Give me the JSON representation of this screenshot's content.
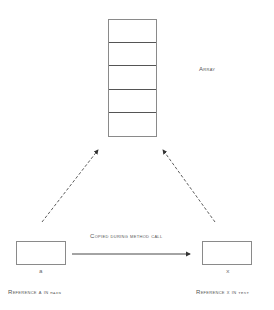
{
  "diagram": {
    "array": {
      "label": "Array",
      "cells": 5
    },
    "left_box": {
      "var": "a",
      "caption_prefix": "Reference a in ",
      "caption_code": "main"
    },
    "right_box": {
      "var": "x",
      "caption_prefix": "Reference x in ",
      "caption_code": "test"
    },
    "arrow_label": "Copied during method call",
    "colors": {
      "stroke": "#333333",
      "box_border": "#8a8a8a",
      "text": "#555555"
    }
  }
}
